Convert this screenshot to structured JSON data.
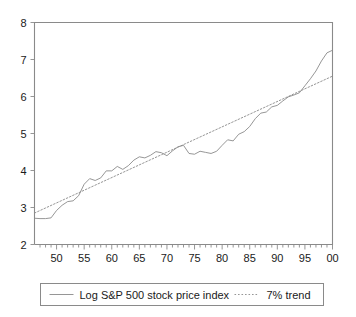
{
  "chart_data": {
    "type": "line",
    "title": "",
    "subtitle": "",
    "xlabel": "",
    "ylabel": "",
    "xlim": [
      1946,
      2000
    ],
    "ylim": [
      2,
      8
    ],
    "grid": false,
    "legend_position": "bottom",
    "y_ticks": [
      "8",
      "7",
      "6",
      "5",
      "4",
      "3",
      "2"
    ],
    "y_tick_values": [
      8,
      7,
      6,
      5,
      4,
      3,
      2
    ],
    "x_ticks": [
      "50",
      "55",
      "60",
      "65",
      "70",
      "75",
      "80",
      "85",
      "90",
      "95",
      "00"
    ],
    "x_tick_values": [
      1950,
      1955,
      1960,
      1965,
      1970,
      1975,
      1980,
      1985,
      1990,
      1995,
      2000
    ],
    "x_minor_step": 1,
    "series": [
      {
        "name": "Log S&P 500 stock price index",
        "style": "solid",
        "color": "#8a8a8a",
        "x": [
          1946,
          1947,
          1948,
          1949,
          1950,
          1951,
          1952,
          1953,
          1954,
          1955,
          1956,
          1957,
          1958,
          1959,
          1960,
          1961,
          1962,
          1963,
          1964,
          1965,
          1966,
          1967,
          1968,
          1969,
          1970,
          1971,
          1972,
          1973,
          1974,
          1975,
          1976,
          1977,
          1978,
          1979,
          1980,
          1981,
          1982,
          1983,
          1984,
          1985,
          1986,
          1987,
          1988,
          1989,
          1990,
          1991,
          1992,
          1993,
          1994,
          1995,
          1996,
          1997,
          1998,
          1999,
          2000
        ],
        "y": [
          2.71,
          2.7,
          2.7,
          2.72,
          2.92,
          3.06,
          3.16,
          3.18,
          3.32,
          3.63,
          3.78,
          3.73,
          3.8,
          3.99,
          3.99,
          4.11,
          4.03,
          4.13,
          4.28,
          4.37,
          4.34,
          4.41,
          4.51,
          4.48,
          4.4,
          4.53,
          4.64,
          4.68,
          4.46,
          4.44,
          4.52,
          4.49,
          4.46,
          4.52,
          4.68,
          4.83,
          4.8,
          4.98,
          5.05,
          5.19,
          5.4,
          5.55,
          5.58,
          5.72,
          5.76,
          5.88,
          5.99,
          6.04,
          6.1,
          6.29,
          6.48,
          6.69,
          6.96,
          7.18,
          7.25
        ]
      },
      {
        "name": "7% trend",
        "style": "dotted",
        "color": "#8a8a8a",
        "x": [
          1946,
          2000
        ],
        "y": [
          2.85,
          6.55
        ]
      }
    ],
    "legend": [
      {
        "label": "Log S&P 500 stock price index",
        "style": "solid"
      },
      {
        "label": "7% trend",
        "style": "dotted"
      }
    ]
  }
}
